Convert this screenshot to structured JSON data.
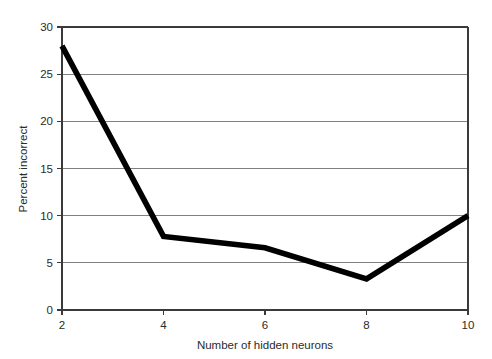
{
  "chart_data": {
    "type": "line",
    "title": "",
    "subtitle": "",
    "xlabel": "Number of hidden neurons",
    "ylabel": "Percent incorrect",
    "x": [
      2,
      4,
      6,
      8,
      10
    ],
    "values": [
      28,
      7.8,
      6.6,
      3.3,
      10
    ],
    "series": [
      {
        "name": "Percent incorrect",
        "x": [
          2,
          4,
          6,
          8,
          10
        ],
        "values": [
          28,
          7.8,
          6.6,
          3.3,
          10
        ],
        "color": "#000000",
        "line_width": 5.6
      }
    ],
    "xlim": [
      2,
      10
    ],
    "ylim": [
      0,
      30
    ],
    "xticks": [
      2,
      4,
      6,
      8,
      10
    ],
    "yticks": [
      0,
      5,
      10,
      15,
      20,
      25,
      30
    ],
    "xtick_labels": [
      "2",
      "4",
      "6",
      "8",
      "10"
    ],
    "ytick_labels": [
      "0",
      "5",
      "10",
      "15",
      "20",
      "25",
      "30"
    ],
    "grid": "horizontal",
    "grid_color": "#808080",
    "axis_color": "#3a3a3a",
    "background": "#ffffff",
    "legend": "none",
    "legend_position": "none",
    "annotations": []
  },
  "axes": {
    "y_title": "Percent incorrect",
    "x_title": "Number of hidden neurons",
    "y_tick_labels": [
      "30",
      "25",
      "20",
      "15",
      "10",
      "5",
      "0"
    ],
    "x_tick_labels": [
      "2",
      "4",
      "6",
      "8",
      "10"
    ]
  },
  "colors": {
    "line": "#000000",
    "grid": "#808080",
    "axis": "#3a3a3a",
    "text": "#2b2b2b",
    "background": "#ffffff"
  }
}
